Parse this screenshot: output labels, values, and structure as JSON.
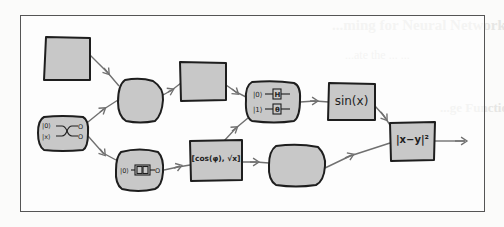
{
  "figure": {
    "type": "hand-drawn computation graph",
    "colors": {
      "node_fill": "#c8c8c8",
      "stroke": "#1e1e1e",
      "edge": "#707070",
      "frame": "#555555",
      "bleed_text": "#e6e6e4"
    },
    "nodes": [
      {
        "id": "n1",
        "shape": "square",
        "label": ""
      },
      {
        "id": "n2",
        "shape": "blob",
        "label": ""
      },
      {
        "id": "n3",
        "shape": "square",
        "label": ""
      },
      {
        "id": "n4",
        "shape": "rounded",
        "label": "",
        "circuit": {
          "lines": [
            {
              "input": "|0⟩",
              "gate": "H"
            },
            {
              "input": "|1⟩",
              "gate": "θ"
            }
          ]
        }
      },
      {
        "id": "n5",
        "shape": "square",
        "label": "sin(x)"
      },
      {
        "id": "n6",
        "shape": "rounded",
        "label": "",
        "circuit": {
          "lines": [
            {
              "input": "|0⟩",
              "output": "O"
            },
            {
              "input": "|x⟩",
              "output": "O"
            }
          ],
          "type": "swap"
        }
      },
      {
        "id": "n7",
        "shape": "blob",
        "label": "",
        "circuit": {
          "input": "|0⟩",
          "gate": "U(x)",
          "output": "O"
        }
      },
      {
        "id": "n8",
        "shape": "square",
        "label": "[cos(φ), √x]"
      },
      {
        "id": "n9",
        "shape": "blob",
        "label": ""
      },
      {
        "id": "n10",
        "shape": "square",
        "label": "|x−y|²"
      }
    ],
    "edges": [
      [
        "n1",
        "n2"
      ],
      [
        "n6",
        "n2"
      ],
      [
        "n6",
        "n7"
      ],
      [
        "n2",
        "n3"
      ],
      [
        "n3",
        "n4"
      ],
      [
        "n8",
        "n4"
      ],
      [
        "n7",
        "n8"
      ],
      [
        "n4",
        "n5"
      ],
      [
        "n5",
        "n10"
      ],
      [
        "n8",
        "n9"
      ],
      [
        "n9",
        "n10"
      ],
      [
        "n10",
        "output"
      ]
    ]
  },
  "bleed_through": {
    "heading_1": "...ming for Neural Networks",
    "line_1": "...ate the ... ...",
    "heading_2": "...ge Function..."
  }
}
